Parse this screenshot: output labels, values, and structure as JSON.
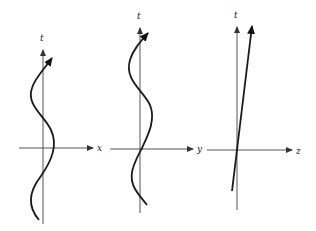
{
  "panels": [
    {
      "id": "xt",
      "vertical_label": "t",
      "horizontal_label": "x",
      "trajectory": "sinusoidal oscillation in x over time"
    },
    {
      "id": "yt",
      "vertical_label": "t",
      "horizontal_label": "y",
      "trajectory": "sinusoidal oscillation in y over time"
    },
    {
      "id": "zt",
      "vertical_label": "t",
      "horizontal_label": "z",
      "trajectory": "straight line, uniform motion in z"
    }
  ],
  "colors": {
    "axis": "#555555",
    "curve": "#1a1a1a",
    "background": "#ffffff"
  }
}
